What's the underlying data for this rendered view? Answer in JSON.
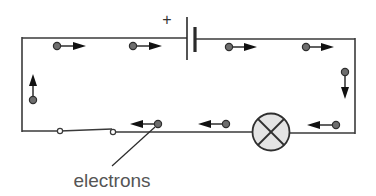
{
  "diagram": {
    "battery": {
      "polarity_label": "+"
    },
    "label": {
      "text": "electrons"
    },
    "components": [
      {
        "type": "cell",
        "name": "battery",
        "terminal_marked": "+"
      },
      {
        "type": "switch",
        "name": "switch",
        "state": "closed"
      },
      {
        "type": "lamp",
        "name": "bulb"
      }
    ],
    "electron_flow": [
      {
        "segment": "top-left",
        "direction": "right"
      },
      {
        "segment": "top-left",
        "direction": "right"
      },
      {
        "segment": "top-right",
        "direction": "right"
      },
      {
        "segment": "top-right",
        "direction": "right"
      },
      {
        "segment": "right",
        "direction": "down"
      },
      {
        "segment": "bottom-right",
        "direction": "left"
      },
      {
        "segment": "bottom-middle",
        "direction": "left"
      },
      {
        "segment": "bottom-left",
        "direction": "left"
      },
      {
        "segment": "left",
        "direction": "up"
      }
    ],
    "colors": {
      "wire": "#3a3a3a",
      "electron": "#6e6e6e",
      "lamp_fill": "#e4e4e4",
      "label": "#555555"
    }
  }
}
